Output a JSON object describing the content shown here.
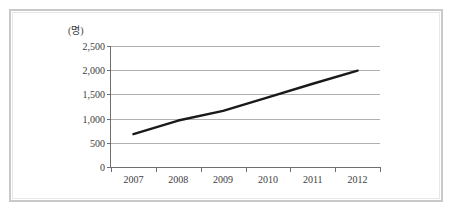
{
  "chart_data": {
    "type": "line",
    "title": "",
    "subtitle": "",
    "xlabel": "",
    "ylabel": "",
    "unit_label": "(명)",
    "categories": [
      "2007",
      "2008",
      "2009",
      "2010",
      "2011",
      "2012"
    ],
    "series": [
      {
        "name": "",
        "values": [
          680,
          960,
          1160,
          1440,
          1720,
          1990
        ]
      }
    ],
    "ytick_labels": [
      "2,500",
      "2,000",
      "1,500",
      "1,000",
      "500",
      "0"
    ],
    "ytick_values": [
      2500,
      2000,
      1500,
      1000,
      500,
      0
    ],
    "ylim": [
      0,
      2500
    ],
    "grid": "horizontal",
    "legend": "none",
    "line_color": "#1a1a1a",
    "grid_color": "#b0b0b0",
    "axis_color": "#6e6e6e",
    "text_color": "#3d3d3d",
    "frame_color": "#c9c9c9"
  }
}
